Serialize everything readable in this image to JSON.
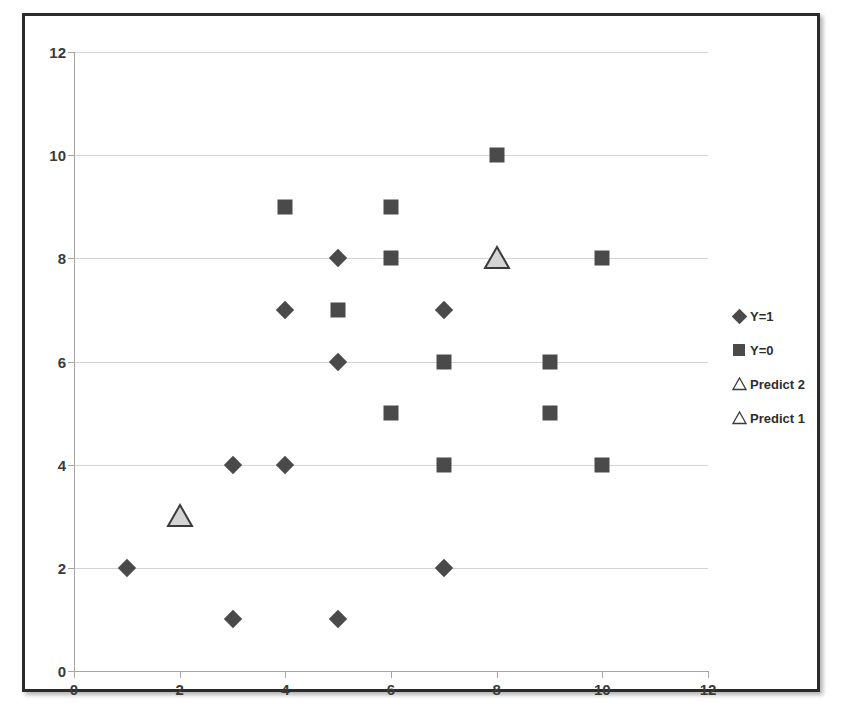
{
  "chart_data": {
    "type": "scatter",
    "title": "",
    "xlabel": "",
    "ylabel": "",
    "xlim": [
      0,
      12
    ],
    "ylim": [
      0,
      12
    ],
    "xticks": [
      0,
      2,
      4,
      6,
      8,
      10,
      12
    ],
    "yticks": [
      0,
      2,
      4,
      6,
      8,
      10,
      12
    ],
    "grid": "horizontal",
    "legend_position": "right",
    "marker_color": "#4a4a4a",
    "predict_fill_color": "#d4d4d4",
    "predict_outline_color": "#3a3a3a",
    "series": [
      {
        "name": "Y=1",
        "marker": "diamond",
        "points": [
          {
            "x": 1,
            "y": 2
          },
          {
            "x": 3,
            "y": 1
          },
          {
            "x": 3,
            "y": 4
          },
          {
            "x": 4,
            "y": 4
          },
          {
            "x": 4,
            "y": 7
          },
          {
            "x": 5,
            "y": 1
          },
          {
            "x": 5,
            "y": 6
          },
          {
            "x": 5,
            "y": 8
          },
          {
            "x": 7,
            "y": 2
          },
          {
            "x": 7,
            "y": 7
          }
        ]
      },
      {
        "name": "Y=0",
        "marker": "square",
        "points": [
          {
            "x": 4,
            "y": 9
          },
          {
            "x": 5,
            "y": 7
          },
          {
            "x": 6,
            "y": 5
          },
          {
            "x": 6,
            "y": 8
          },
          {
            "x": 6,
            "y": 9
          },
          {
            "x": 7,
            "y": 4
          },
          {
            "x": 7,
            "y": 6
          },
          {
            "x": 8,
            "y": 10
          },
          {
            "x": 9,
            "y": 5
          },
          {
            "x": 9,
            "y": 6
          },
          {
            "x": 10,
            "y": 4
          },
          {
            "x": 10,
            "y": 8
          }
        ]
      },
      {
        "name": "Predict 2",
        "marker": "triangle",
        "points": [
          {
            "x": 8,
            "y": 8
          }
        ]
      },
      {
        "name": "Predict 1",
        "marker": "triangle",
        "points": [
          {
            "x": 2,
            "y": 3
          }
        ]
      }
    ],
    "legend": [
      {
        "label": "Y=1",
        "marker": "diamond"
      },
      {
        "label": "Y=0",
        "marker": "square"
      },
      {
        "label": "Predict 2",
        "marker": "triangle"
      },
      {
        "label": "Predict 1",
        "marker": "triangle"
      }
    ]
  }
}
